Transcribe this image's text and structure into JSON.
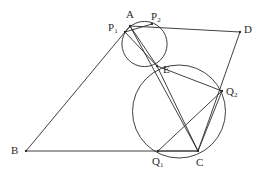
{
  "figure": {
    "kind": "euclidean-geometry-diagram",
    "width": 262,
    "height": 184,
    "background_color": "#ffffff",
    "stroke_color": "#2b2b2b",
    "stroke_width": 0.9
  },
  "points": [
    {
      "id": "A",
      "label": "A",
      "sub": "",
      "x": 130,
      "y": 26,
      "label_x": 126,
      "label_y": 9,
      "on_curve": true
    },
    {
      "id": "B",
      "label": "B",
      "sub": "",
      "x": 26,
      "y": 151,
      "label_x": 11,
      "label_y": 145,
      "on_curve": true
    },
    {
      "id": "C",
      "label": "C",
      "sub": "",
      "x": 198,
      "y": 151,
      "label_x": 196,
      "label_y": 157,
      "on_curve": true
    },
    {
      "id": "D",
      "label": "D",
      "sub": "",
      "x": 240,
      "y": 32,
      "label_x": 244,
      "label_y": 24,
      "on_curve": true
    },
    {
      "id": "E",
      "label": "E",
      "sub": "",
      "x": 157,
      "y": 66,
      "label_x": 163,
      "label_y": 64,
      "on_curve": true
    },
    {
      "id": "P1",
      "label": "P",
      "sub": "1",
      "x": 125,
      "y": 32,
      "label_x": 108,
      "label_y": 22,
      "on_curve": true
    },
    {
      "id": "P2",
      "label": "P",
      "sub": "2",
      "x": 152,
      "y": 24,
      "label_x": 151,
      "label_y": 11,
      "on_curve": true
    },
    {
      "id": "Q1",
      "label": "Q",
      "sub": "1",
      "x": 158,
      "y": 151,
      "label_x": 152,
      "label_y": 156,
      "on_curve": true
    },
    {
      "id": "Q2",
      "label": "Q",
      "sub": "2",
      "x": 222,
      "y": 91,
      "label_x": 226,
      "label_y": 86,
      "on_curve": true
    }
  ],
  "circles": [
    {
      "id": "small-circle",
      "name": "circle-through-A-P1-P2-E",
      "cx": 144.5,
      "cy": 44.0,
      "r": 22.6
    },
    {
      "id": "large-circle",
      "name": "circle-through-E-Q1-Q2-C",
      "cx": 179.0,
      "cy": 111.5,
      "r": 46.5
    }
  ],
  "segments": [
    {
      "id": "AB",
      "name": "segment-a-b",
      "from": "A",
      "to": "B"
    },
    {
      "id": "BC",
      "name": "segment-b-c",
      "from": "B",
      "to": "C"
    },
    {
      "id": "AD",
      "name": "segment-a-d",
      "from": "A",
      "to": "D"
    },
    {
      "id": "DC",
      "name": "segment-d-c",
      "from": "D",
      "to": "C"
    },
    {
      "id": "AC",
      "name": "diagonal-a-c",
      "from": "A",
      "to": "C"
    },
    {
      "id": "P1P2",
      "name": "chord-p1-p2",
      "from": "P1",
      "to": "P2"
    },
    {
      "id": "P1E",
      "name": "chord-p1-e",
      "from": "P1",
      "to": "E"
    },
    {
      "id": "AE",
      "name": "chord-a-e",
      "from": "A",
      "to": "E"
    },
    {
      "id": "Q1Q2",
      "name": "chord-q1-q2",
      "from": "Q1",
      "to": "Q2"
    },
    {
      "id": "Q1C",
      "name": "chord-q1-c",
      "from": "Q1",
      "to": "C"
    },
    {
      "id": "EQ2",
      "name": "chord-e-q2",
      "from": "E",
      "to": "Q2"
    },
    {
      "id": "Q2C",
      "name": "chord-q2-c",
      "from": "Q2",
      "to": "C"
    },
    {
      "id": "EC",
      "name": "segment-e-c",
      "from": "E",
      "to": "C"
    }
  ]
}
